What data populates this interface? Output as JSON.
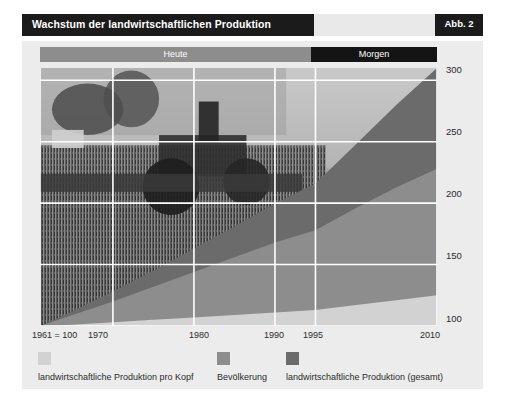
{
  "figure": {
    "title": "Wachstum der landwirtschaftlichen Produktion",
    "badge": "Abb. 2"
  },
  "era_banner": {
    "left_label": "Heute",
    "right_label": "Morgen",
    "left_color": "#8d8d8d",
    "right_color": "#141414",
    "split_year": 1995
  },
  "legend": {
    "items": [
      {
        "label": "landwirtschaftliche Produktion pro Kopf",
        "color": "#d2d2d2"
      },
      {
        "label": "Bevölkerung",
        "color": "#8d8d8d"
      },
      {
        "label": "landwirtschaftliche Produktion (gesamt)",
        "color": "#6b6b6b"
      }
    ]
  },
  "chart_data": {
    "type": "area",
    "title": "Wachstum der landwirtschaftlichen Produktion",
    "xlabel": "",
    "ylabel": "",
    "xlim": [
      1961,
      2010
    ],
    "ylim": [
      100,
      310
    ],
    "grid": true,
    "legend_position": "bottom",
    "stacked": false,
    "note": "1961 = 100",
    "x": [
      1961,
      1965,
      1970,
      1975,
      1980,
      1985,
      1990,
      1995,
      2000,
      2005,
      2010
    ],
    "xticks": [
      1961,
      1970,
      1980,
      1990,
      1995,
      2010
    ],
    "xticklabels": [
      "1961 = 100",
      "1970",
      "1980",
      "1990",
      "1995",
      "2010"
    ],
    "yticks": [
      100,
      150,
      200,
      250,
      300
    ],
    "yticklabels": [
      "100",
      "150",
      "200",
      "250",
      "300"
    ],
    "series": [
      {
        "name": "landwirtschaftliche Produktion (gesamt)",
        "color": "#6b6b6b",
        "values": [
          100,
          112,
          128,
          145,
          163,
          181,
          200,
          216,
          248,
          280,
          310
        ]
      },
      {
        "name": "Bevölkerung",
        "color": "#8d8d8d",
        "values": [
          100,
          109,
          120,
          132,
          144,
          156,
          168,
          178,
          196,
          213,
          228
        ]
      },
      {
        "name": "landwirtschaftliche Produktion pro Kopf",
        "color": "#d2d2d2",
        "values": [
          100,
          101,
          103,
          105,
          107,
          109,
          111,
          113,
          117,
          121,
          125
        ]
      }
    ]
  }
}
